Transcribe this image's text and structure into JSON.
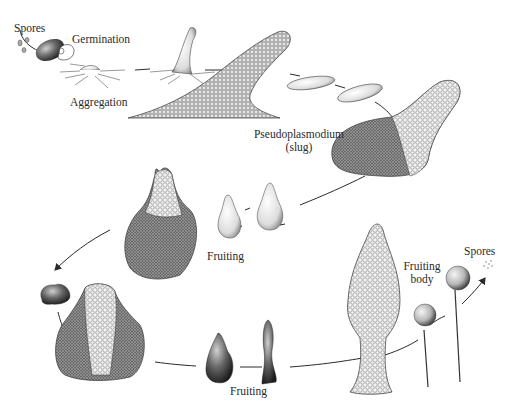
{
  "diagram": {
    "labels": {
      "spores_start": "Spores",
      "germination": "Germination",
      "aggregation": "Aggregation",
      "pseudoplasmodium_line1": "Pseudoplasmodium",
      "pseudoplasmodium_line2": "(slug)",
      "fruiting_upper": "Fruiting",
      "fruiting_lower": "Fruiting",
      "fruiting_body_line1": "Fruiting",
      "fruiting_body_line2": "body",
      "spores_end": "Spores"
    },
    "colors": {
      "ink": "#2a2a2a",
      "texture_dark": "#555555",
      "texture_light": "#9a9a9a",
      "background": "#ffffff"
    }
  }
}
